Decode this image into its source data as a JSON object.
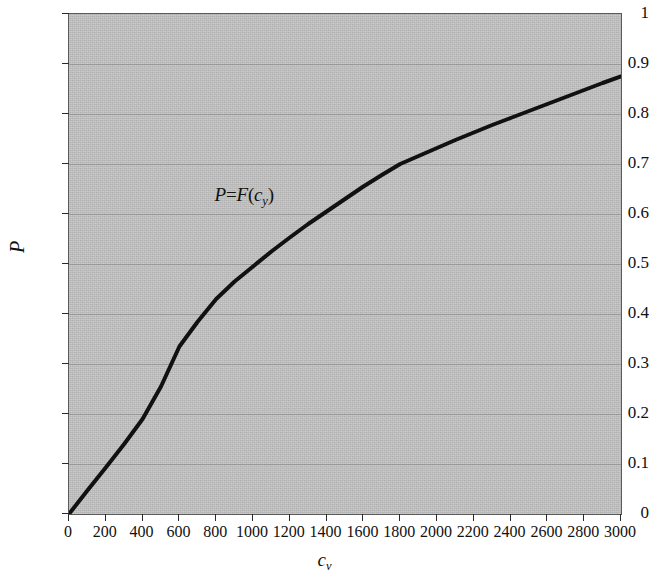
{
  "figure": {
    "background_color": "#ffffff",
    "plot_background_color": "#bcbcbc",
    "curve_color": "#111111",
    "gridline_color": "#8e8e8e",
    "axis_color": "#5a5a5a"
  },
  "axes": {
    "y": {
      "label": "P",
      "ticks": [
        "1",
        "0.9",
        "0.8",
        "0.7",
        "0.6",
        "0.5",
        "0.4",
        "0.3",
        "0.2",
        "0.1",
        "0"
      ],
      "tick_values": [
        1,
        0.9,
        0.8,
        0.7,
        0.6,
        0.5,
        0.4,
        0.3,
        0.2,
        0.1,
        0
      ],
      "min": 0,
      "max": 1
    },
    "x": {
      "label_base": "c",
      "label_sub": "v",
      "ticks": [
        "0",
        "200",
        "400",
        "600",
        "800",
        "1000",
        "1200",
        "1400",
        "1600",
        "1800",
        "2000",
        "2200",
        "2400",
        "2600",
        "2800",
        "3000"
      ],
      "tick_values": [
        0,
        200,
        400,
        600,
        800,
        1000,
        1200,
        1400,
        1600,
        1800,
        2000,
        2200,
        2400,
        2600,
        2800,
        3000
      ],
      "min": 0,
      "max": 3000
    }
  },
  "annotation": {
    "text": "P=F(c_y)",
    "part_p": "P",
    "part_eq": "=",
    "part_f": "F",
    "part_open": "(",
    "part_c": "c",
    "part_sub": "y",
    "part_close": ")"
  },
  "chart_data": {
    "type": "line",
    "title": "",
    "subtitle": "",
    "xlabel": "c_v",
    "ylabel": "P",
    "xlim": [
      0,
      3000
    ],
    "ylim": [
      0,
      1
    ],
    "grid": true,
    "legend": null,
    "annotations": [
      {
        "text": "P=F(c_y)",
        "x": 1150,
        "y": 0.635
      }
    ],
    "series": [
      {
        "name": "P=F(c_v)",
        "x": [
          0,
          100,
          200,
          300,
          400,
          500,
          600,
          700,
          800,
          900,
          1000,
          1100,
          1200,
          1300,
          1400,
          1500,
          1600,
          1700,
          1800,
          1900,
          2000,
          2100,
          2200,
          2300,
          2400,
          2500,
          2600,
          2700,
          2800,
          2900,
          3000
        ],
        "y": [
          0.0,
          0.047,
          0.093,
          0.14,
          0.19,
          0.255,
          0.335,
          0.385,
          0.43,
          0.465,
          0.495,
          0.525,
          0.553,
          0.58,
          0.605,
          0.63,
          0.655,
          0.678,
          0.7,
          0.716,
          0.732,
          0.748,
          0.763,
          0.778,
          0.792,
          0.806,
          0.82,
          0.834,
          0.848,
          0.862,
          0.875
        ]
      }
    ]
  }
}
